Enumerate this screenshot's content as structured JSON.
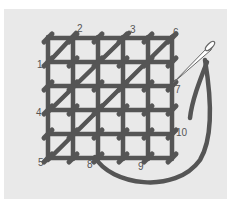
{
  "diagram": {
    "type": "embroidery-stitch-diagram",
    "colors": {
      "background": "#ffffff",
      "panel": "#e9e9e9",
      "thread": "#555555",
      "needle": "#ffffff",
      "needle_outline": "#666666",
      "label": "#555555"
    },
    "grid": {
      "columns": 5,
      "rows": 5
    },
    "labels": [
      {
        "text": "1",
        "x": 37,
        "y": 68
      },
      {
        "text": "2",
        "x": 77,
        "y": 32
      },
      {
        "text": "3",
        "x": 130,
        "y": 33
      },
      {
        "text": "4",
        "x": 36,
        "y": 116
      },
      {
        "text": "5",
        "x": 38,
        "y": 166
      },
      {
        "text": "6",
        "x": 173,
        "y": 36
      },
      {
        "text": "7",
        "x": 175,
        "y": 93
      },
      {
        "text": "8",
        "x": 87,
        "y": 168
      },
      {
        "text": "9",
        "x": 138,
        "y": 170
      },
      {
        "text": "10",
        "x": 176,
        "y": 136
      }
    ]
  }
}
